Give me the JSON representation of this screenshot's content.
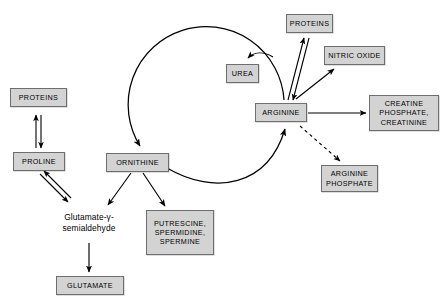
{
  "diagram": {
    "canvas": {
      "width": 443,
      "height": 307
    },
    "style": {
      "node_fill": "#d3d3d3",
      "node_border": "#6e6e6e",
      "text_color": "#000000",
      "edge_color": "#000000",
      "background": "#ffffff"
    },
    "nodes": {
      "proteins_left": {
        "label": "PROTEINS"
      },
      "proline": {
        "label": "PROLINE"
      },
      "glutamate_semialdehyde": {
        "label": "Glutamate-γ-\nsemialdehyde"
      },
      "glutamate": {
        "label": "GLUTAMATE"
      },
      "ornithine": {
        "label": "ORNITHINE"
      },
      "putrescine": {
        "label": "PUTRESCINE,\nSPERMIDINE,\nSPERMINE"
      },
      "urea": {
        "label": "UREA"
      },
      "arginine": {
        "label": "ARGININE"
      },
      "proteins_top": {
        "label": "PROTEINS"
      },
      "nitric_oxide": {
        "label": "NITRIC OXIDE"
      },
      "creatine": {
        "label": "CREATINE\nPHOSPHATE,\nCREATININE"
      },
      "arginine_phosphate": {
        "label": "ARGININE\nPHOSPHATE"
      }
    },
    "edges": [
      {
        "from": "arginine",
        "to": "urea",
        "type": "solid-arrow"
      },
      {
        "from": "arginine",
        "to": "ornithine",
        "type": "cycle-arc-upper"
      },
      {
        "from": "ornithine",
        "to": "arginine",
        "type": "cycle-arc-lower"
      },
      {
        "from": "proteins_left",
        "to": "proline",
        "type": "double-reversible"
      },
      {
        "from": "proline",
        "to": "glutamate_semialdehyde",
        "type": "double-reversible"
      },
      {
        "from": "glutamate_semialdehyde",
        "to": "glutamate",
        "type": "solid-arrow"
      },
      {
        "from": "ornithine",
        "to": "glutamate_semialdehyde",
        "type": "solid-arrow"
      },
      {
        "from": "ornithine",
        "to": "putrescine",
        "type": "solid-arrow"
      },
      {
        "from": "proteins_top",
        "to": "arginine",
        "type": "double-reversible"
      },
      {
        "from": "arginine",
        "to": "nitric_oxide",
        "type": "solid-arrow"
      },
      {
        "from": "arginine",
        "to": "creatine",
        "type": "solid-arrow"
      },
      {
        "from": "arginine",
        "to": "arginine_phosphate",
        "type": "dashed-arrow"
      }
    ]
  }
}
